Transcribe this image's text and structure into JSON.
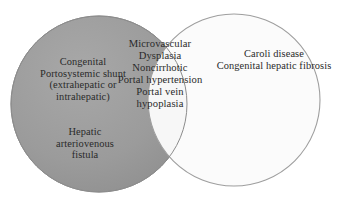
{
  "figure": {
    "type": "venn-diagram",
    "set_count": 2,
    "background_color": "#ffffff",
    "text_color": "#2a2a2a"
  },
  "colors": {
    "left_circle_fill": "#9a9a9a",
    "left_circle_stroke": "#8c8c8c",
    "right_circle_fill": "#fbfbfb",
    "right_circle_stroke": "#9e9e9e",
    "overlap_fill": "#f7f7f7",
    "text": "#2a2a2a"
  },
  "left_circle": {
    "name": "left-set",
    "fill": "#9a9a9a",
    "cx": 99,
    "cy": 104,
    "r": 88,
    "items": [
      {
        "name": "congenital-portosystemic-shunt",
        "text": "Congenital\nPortosystemic shunt\n(extrahepatic or\nintrahepatic)"
      },
      {
        "name": "hepatic-arteriovenous-fistula",
        "text": "Hepatic\narteriovenous\nfistula"
      }
    ]
  },
  "overlap": {
    "name": "overlap-set",
    "fill": "#f7f7f7",
    "items": [
      {
        "name": "overlap-conditions",
        "text": "Microvascular\nDysplasia\nNoncirrhotic\nPortal hypertension\nPortal vein\nhypoplasia"
      }
    ]
  },
  "right_circle": {
    "name": "right-set",
    "fill": "#fbfbfb",
    "cx": 234,
    "cy": 100,
    "r": 86,
    "items": [
      {
        "name": "caroli-and-fibrosis",
        "text": "Caroli disease\nCongenital hepatic fibrosis"
      }
    ]
  }
}
